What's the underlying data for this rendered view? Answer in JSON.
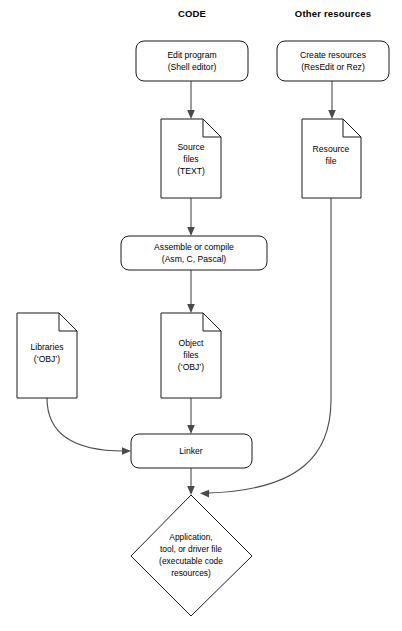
{
  "diagram": {
    "colors": {
      "background": "#ffffff",
      "shape_stroke": "#1a1a1a",
      "connector": "#4a4a4a",
      "text": "#000000"
    },
    "columns": [
      {
        "id": "code",
        "label": "CODE"
      },
      {
        "id": "other",
        "label": "Other resources"
      }
    ],
    "nodes": {
      "edit_program": {
        "shape": "rounded-rect",
        "lines": [
          "Edit program",
          "(Shell editor)"
        ]
      },
      "create_resources": {
        "shape": "rounded-rect",
        "lines": [
          "Create resources",
          "(ResEdit or Rez)"
        ]
      },
      "source_files": {
        "shape": "document",
        "lines": [
          "Source",
          "files",
          "(TEXT)"
        ]
      },
      "resource_file": {
        "shape": "document",
        "lines": [
          "Resource",
          "file"
        ]
      },
      "assemble": {
        "shape": "rounded-rect",
        "lines": [
          "Assemble or compile",
          "(Asm, C, Pascal)"
        ]
      },
      "libraries": {
        "shape": "document",
        "lines": [
          "Libraries",
          "(‘OBJ’)"
        ]
      },
      "object_files": {
        "shape": "document",
        "lines": [
          "Object",
          "files",
          "(‘OBJ’)"
        ]
      },
      "linker": {
        "shape": "rounded-rect",
        "lines": [
          "Linker"
        ]
      },
      "output": {
        "shape": "diamond",
        "lines": [
          "Application,",
          "tool, or driver file",
          "(executable code",
          "resources)"
        ]
      }
    },
    "edges": [
      {
        "id": "edit-to-source",
        "from": "edit_program",
        "to": "source_files",
        "style": "straight-arrow"
      },
      {
        "id": "create-to-resource",
        "from": "create_resources",
        "to": "resource_file",
        "style": "straight-arrow"
      },
      {
        "id": "source-to-assemble",
        "from": "source_files",
        "to": "assemble",
        "style": "straight-arrow"
      },
      {
        "id": "assemble-to-object",
        "from": "assemble",
        "to": "object_files",
        "style": "straight-arrow"
      },
      {
        "id": "object-to-linker",
        "from": "object_files",
        "to": "linker",
        "style": "straight-arrow"
      },
      {
        "id": "libraries-to-linker",
        "from": "libraries",
        "to": "linker",
        "style": "curved-arrow"
      },
      {
        "id": "linker-to-output",
        "from": "linker",
        "to": "output",
        "style": "straight-arrow"
      },
      {
        "id": "resource-to-output",
        "from": "resource_file",
        "to": "output",
        "style": "curved-arrow"
      }
    ]
  }
}
